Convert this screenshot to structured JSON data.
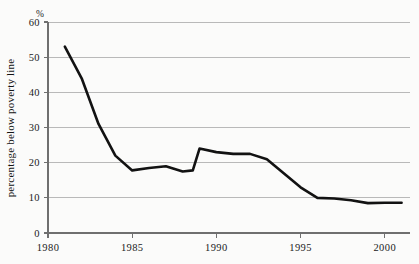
{
  "chart_data": {
    "type": "line",
    "title": "",
    "subtitle": "",
    "xlabel": "",
    "ylabel": "percentage below poverty line",
    "unit_label": "%",
    "xlim": [
      1980,
      2001.5
    ],
    "ylim": [
      0,
      60
    ],
    "grid": true,
    "legend": "none",
    "y_ticks": [
      0,
      10,
      20,
      30,
      40,
      50,
      60
    ],
    "y_tick_labels": [
      "0",
      "10",
      "20",
      "30",
      "40",
      "50",
      "60"
    ],
    "x_ticks": [
      1980,
      1985,
      1990,
      1995,
      2000
    ],
    "x_tick_labels": [
      "1980",
      "1985",
      "1990",
      "1995",
      "2000"
    ],
    "series": [
      {
        "name": "percentage below poverty line",
        "color": "#121212",
        "x": [
          1981,
          1982,
          1983,
          1984,
          1985,
          1986,
          1987,
          1988,
          1988.6,
          1989,
          1990,
          1991,
          1992,
          1993,
          1994,
          1995,
          1996,
          1997,
          1998,
          1999,
          2000,
          2001
        ],
        "values": [
          53,
          44,
          31,
          22,
          17.8,
          18.5,
          19,
          17.5,
          17.8,
          24,
          23,
          22.5,
          22.5,
          21,
          17,
          13,
          10,
          9.8,
          9.3,
          8.5,
          8.6,
          8.6
        ]
      }
    ]
  }
}
